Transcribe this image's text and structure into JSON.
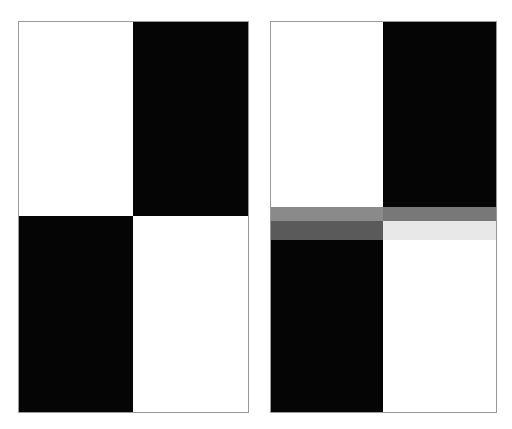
{
  "figure": {
    "width": 512,
    "height": 429,
    "background": "#ffffff"
  },
  "palette": {
    "white": "#ffffff",
    "black": "#050505",
    "panel_border": "#9a9a9a",
    "band_upper_left": "#8a8a8a",
    "band_upper_right": "#787878",
    "band_lower_left": "#5a5a5a",
    "band_lower_right": "#e8e8e8"
  },
  "panels": [
    {
      "id": "left",
      "name": "reference-checkerboard",
      "caption": "",
      "quadrants": [
        {
          "position": "top-left",
          "color": "#ffffff",
          "label": "white"
        },
        {
          "position": "top-right",
          "color": "#050505",
          "label": "black"
        },
        {
          "position": "bottom-left",
          "color": "#050505",
          "label": "black"
        },
        {
          "position": "bottom-right",
          "color": "#ffffff",
          "label": "white"
        }
      ],
      "overlay": null
    },
    {
      "id": "right",
      "name": "checkerboard-with-gray-band",
      "caption": "",
      "quadrants": [
        {
          "position": "top-left",
          "color": "#ffffff",
          "label": "white"
        },
        {
          "position": "top-right",
          "color": "#050505",
          "label": "black"
        },
        {
          "position": "bottom-left",
          "color": "#050505",
          "label": "black"
        },
        {
          "position": "bottom-right",
          "color": "#ffffff",
          "label": "white"
        }
      ],
      "overlay": {
        "name": "horizontal-gray-band",
        "rows": [
          {
            "id": "upper",
            "segments": [
              {
                "side": "left",
                "color": "#8a8a8a",
                "on_background": "white"
              },
              {
                "side": "right",
                "color": "#787878",
                "on_background": "black"
              }
            ]
          },
          {
            "id": "lower",
            "segments": [
              {
                "side": "left",
                "color": "#5a5a5a",
                "on_background": "black"
              },
              {
                "side": "right",
                "color": "#e8e8e8",
                "on_background": "white"
              }
            ]
          }
        ]
      }
    }
  ]
}
